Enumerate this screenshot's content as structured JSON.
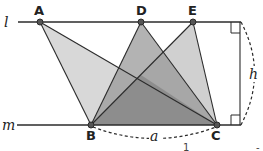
{
  "diagram": {
    "lines": {
      "l_label": "l",
      "m_label": "m"
    },
    "points": {
      "A": "A",
      "D": "D",
      "E": "E",
      "B": "B",
      "C": "C"
    },
    "measures": {
      "base_label": "a",
      "height_label": "h"
    },
    "fragments": {
      "bottom_digit": "1",
      "bottom_dash": "-"
    },
    "colors": {
      "light_fill": "#d2d2d2",
      "mid_fill": "#a9a9a9",
      "dark_fill": "#7e7e7e",
      "stroke": "#2b2b2b",
      "point_fill": "#555555"
    }
  }
}
